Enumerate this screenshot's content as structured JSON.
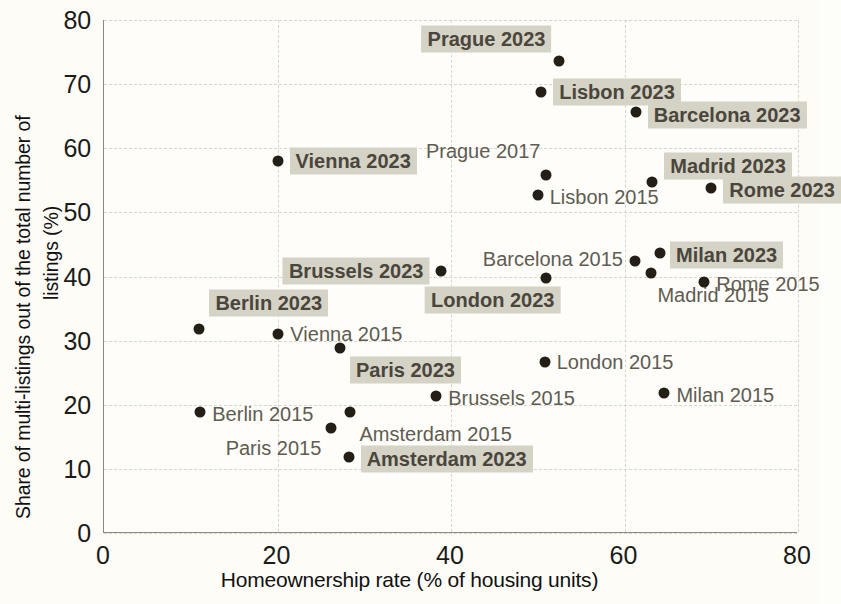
{
  "chart_data": {
    "type": "scatter",
    "title": "",
    "xlabel": "Homeownership rate (% of housing units)",
    "ylabel_line1": "Share of multi-listings out of the total number of",
    "ylabel_line2": "listings (%)",
    "xlim": [
      0,
      80
    ],
    "ylim": [
      0,
      80
    ],
    "xticks": [
      "0",
      "20",
      "40",
      "60",
      "80"
    ],
    "yticks": [
      "0",
      "10",
      "20",
      "30",
      "40",
      "50",
      "60",
      "70",
      "80"
    ],
    "xtick_values": [
      0,
      20,
      40,
      60,
      80
    ],
    "ytick_values": [
      0,
      10,
      20,
      30,
      40,
      50,
      60,
      70,
      80
    ],
    "grid": true,
    "legend": "none",
    "marker_color": "#231f16",
    "highlight_color": "#d5d2c6",
    "points": [
      {
        "label": "Prague 2023",
        "x": 52.5,
        "y": 73.6,
        "style": "bold",
        "align": "left",
        "dx": -8,
        "dy": -22
      },
      {
        "label": "Prague 2017",
        "x": 51.0,
        "y": 55.8,
        "style": "normal",
        "align": "left",
        "dx": -6,
        "dy": -24
      },
      {
        "label": "Lisbon 2023",
        "x": 50.4,
        "y": 68.8,
        "style": "bold",
        "align": "right",
        "dx": 12,
        "dy": 0
      },
      {
        "label": "Lisbon 2015",
        "x": 50.0,
        "y": 52.7,
        "style": "normal",
        "align": "right",
        "dx": 12,
        "dy": 2
      },
      {
        "label": "Barcelona 2023",
        "x": 61.3,
        "y": 65.6,
        "style": "bold",
        "align": "right",
        "dx": 12,
        "dy": 3
      },
      {
        "label": "Barcelona 2015",
        "x": 61.2,
        "y": 42.4,
        "style": "normal",
        "align": "left",
        "dx": -12,
        "dy": -2
      },
      {
        "label": "Madrid 2023",
        "x": 63.2,
        "y": 54.8,
        "style": "bold",
        "align": "right",
        "dx": 12,
        "dy": -16
      },
      {
        "label": "Madrid 2015",
        "x": 63.1,
        "y": 40.6,
        "style": "normal",
        "align": "right",
        "dx": 6,
        "dy": 22
      },
      {
        "label": "Rome 2023",
        "x": 70.0,
        "y": 53.8,
        "style": "bold",
        "align": "right",
        "dx": 12,
        "dy": 2
      },
      {
        "label": "Rome 2015",
        "x": 69.2,
        "y": 39.2,
        "style": "normal",
        "align": "right",
        "dx": 12,
        "dy": 2
      },
      {
        "label": "Milan 2023",
        "x": 64.1,
        "y": 43.7,
        "style": "bold",
        "align": "right",
        "dx": 10,
        "dy": 2
      },
      {
        "label": "Milan 2015",
        "x": 64.6,
        "y": 21.8,
        "style": "normal",
        "align": "right",
        "dx": 12,
        "dy": 2
      },
      {
        "label": "Vienna 2023",
        "x": 20.0,
        "y": 58.0,
        "style": "bold",
        "align": "right",
        "dx": 12,
        "dy": 0
      },
      {
        "label": "Vienna 2015",
        "x": 20.1,
        "y": 31.1,
        "style": "normal",
        "align": "right",
        "dx": 12,
        "dy": 0
      },
      {
        "label": "Brussels 2023",
        "x": 38.9,
        "y": 40.9,
        "style": "bold",
        "align": "left",
        "dx": -12,
        "dy": 0
      },
      {
        "label": "Brussels 2015",
        "x": 38.3,
        "y": 21.3,
        "style": "normal",
        "align": "right",
        "dx": 12,
        "dy": 2
      },
      {
        "label": "London 2023",
        "x": 51.0,
        "y": 39.8,
        "style": "bold",
        "align": "left",
        "dx": 14,
        "dy": 22
      },
      {
        "label": "London 2015",
        "x": 50.8,
        "y": 26.6,
        "style": "normal",
        "align": "right",
        "dx": 12,
        "dy": 0
      },
      {
        "label": "Berlin 2023",
        "x": 11.0,
        "y": 31.8,
        "style": "bold",
        "align": "right",
        "dx": 10,
        "dy": -26
      },
      {
        "label": "Berlin 2015",
        "x": 11.1,
        "y": 18.8,
        "style": "normal",
        "align": "right",
        "dx": 12,
        "dy": 2
      },
      {
        "label": "Paris 2023",
        "x": 27.2,
        "y": 28.9,
        "style": "bold",
        "align": "right",
        "dx": 10,
        "dy": 22
      },
      {
        "label": "Paris 2015",
        "x": 26.2,
        "y": 16.3,
        "style": "normal",
        "align": "left",
        "dx": -10,
        "dy": 20
      },
      {
        "label": "Amsterdam 2023",
        "x": 28.2,
        "y": 11.8,
        "style": "bold",
        "align": "right",
        "dx": 12,
        "dy": 2
      },
      {
        "label": "Amsterdam 2015",
        "x": 28.3,
        "y": 18.9,
        "style": "normal",
        "align": "right",
        "dx": 10,
        "dy": 22
      }
    ]
  }
}
